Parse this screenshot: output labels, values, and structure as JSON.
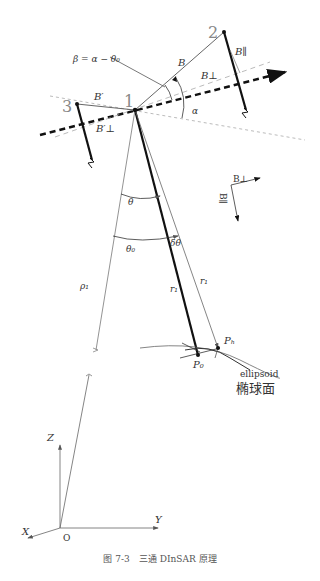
{
  "figure": {
    "caption": "图 7-3　三通 DInSAR 原理",
    "satellites": [
      {
        "id": "1",
        "label": "1"
      },
      {
        "id": "2",
        "label": "2"
      },
      {
        "id": "3",
        "label": "3"
      }
    ],
    "labels": {
      "beta_eq": "β = α − θ₀",
      "B": "B",
      "B_par": "B∥",
      "B_perp": "B⊥",
      "B_prime": "B′",
      "B_prime_perp": "B′⊥",
      "alpha": "α",
      "theta": "θ",
      "theta0": "θ₀",
      "dtheta": "δθ",
      "rho1": "ρ₁",
      "r1_a": "r₁",
      "r1_b": "r₁",
      "Ph": "Pₕ",
      "P0": "P₀",
      "ellipsoid_en": "ellipsoid",
      "ellipsoid_zh": "椭球面",
      "legend_Bperp": "B⊥",
      "legend_Bpar": "B∥",
      "axis_Z": "Z",
      "axis_Y": "Y",
      "axis_X": "X",
      "origin": "O"
    }
  }
}
